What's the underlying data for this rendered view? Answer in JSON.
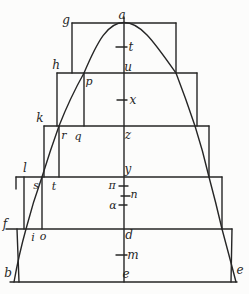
{
  "figure": {
    "ink_color": "#262626",
    "paper_color": "#fcfcfb",
    "labels": {
      "a": "a",
      "g": "g",
      "h": "h",
      "k": "k",
      "l": "l",
      "f": "f",
      "b": "b",
      "p": "p",
      "q": "q",
      "r": "r",
      "s": "s",
      "t_foot": "t",
      "i": "i",
      "o": "o",
      "u": "u",
      "z": "z",
      "y": "y",
      "d": "d",
      "e_center": "e",
      "e_right": "e",
      "t_axis": "t",
      "x_axis": "x",
      "m_axis": "m",
      "pi": "π",
      "n": "n",
      "alpha": "α"
    },
    "axis_labels_top_to_bottom": [
      "a",
      "t",
      "u",
      "x",
      "z",
      "y",
      "π",
      "n",
      "α",
      "d",
      "m",
      "e"
    ],
    "left_edge_labels_top_to_bottom": [
      "g",
      "h",
      "k",
      "l",
      "f",
      "b"
    ],
    "step_point_labels": [
      "p",
      "q",
      "r",
      "s",
      "t",
      "i",
      "o"
    ],
    "bottom_right_label": "e"
  }
}
